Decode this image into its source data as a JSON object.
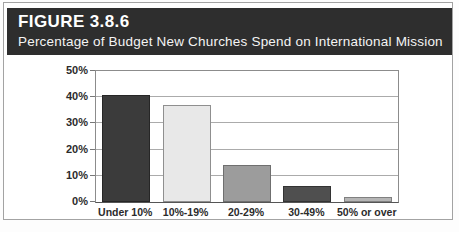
{
  "figure": {
    "label": "FIGURE 3.8.6",
    "subtitle": "Percentage of Budget New Churches Spend on International Mission"
  },
  "chart_data": {
    "type": "bar",
    "title": "Percentage of Budget New Churches Spend on International Mission",
    "categories": [
      "Under 10%",
      "10%-19%",
      "20-29%",
      "30-49%",
      "50% or over"
    ],
    "values": [
      41,
      37,
      14,
      6,
      2
    ],
    "bar_colors": [
      "#3b3b3b",
      "#e8e8e8",
      "#9c9c9c",
      "#4f4f4f",
      "#b5b5b5"
    ],
    "bar_border_colors": [
      "#262626",
      "#8f8f8f",
      "#6f6f6f",
      "#333333",
      "#808080"
    ],
    "xlabel": "",
    "ylabel": "",
    "ylim": [
      0,
      50
    ],
    "ytick_step": 10,
    "ytick_labels": [
      "0%",
      "10%",
      "20%",
      "30%",
      "40%",
      "50%"
    ],
    "grid": "horizontal",
    "legend": "none"
  },
  "colors": {
    "header_bg": "#2e2e2e",
    "header_text": "#ffffff",
    "frame_border": "#a3a3a3",
    "grid_line": "#ababab",
    "axis_text": "#2b2b2b"
  }
}
